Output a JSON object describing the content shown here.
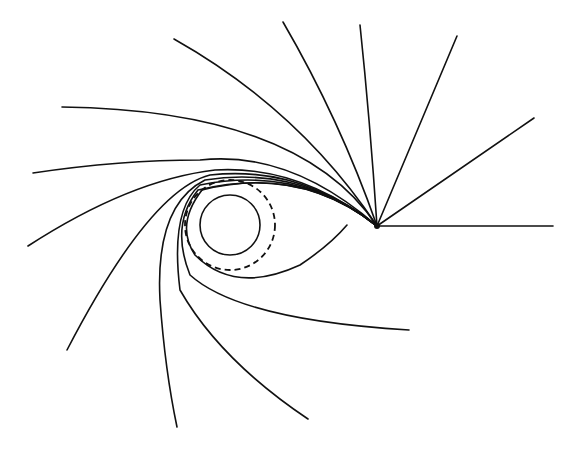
{
  "diagram": {
    "title": "",
    "colors": {
      "line": "#111111",
      "background": "#ffffff"
    },
    "emitter": {
      "x": 377,
      "y": 226
    },
    "horizon": {
      "cx": 230,
      "cy": 225,
      "r": 30
    },
    "photon_sphere": {
      "cx": 230,
      "cy": 225,
      "r": 45
    },
    "rays": [
      "M377,226 L553,226",
      "M377,226 L534,118",
      "M377,226 L457,36",
      "M377,226 Q370,120 360,25",
      "M377,226 Q340,120 283,22",
      "M377,226 Q300,110 174,39",
      "M377,226 Q300,110 62,107",
      "M377,226 Q290,150 200,160 Q120,160 33,173",
      "M377,226 Q300,165 215,170 Q130,180 28,246",
      "M377,226 Q300,165 210,175 Q150,190 67,350",
      "M377,226 Q300,165 205,180 Q155,205 160,300 Q165,370 177,427",
      "M377,226 Q300,165 200,185 Q170,210 180,290 Q220,360 308,419",
      "M377,226 Q300,165 198,190 Q170,225 190,275 Q240,320 409,330",
      "M377,226 Q300,165 202,190 Q175,225 195,255 Q235,295 300,265 Q330,245 347,225"
    ]
  }
}
